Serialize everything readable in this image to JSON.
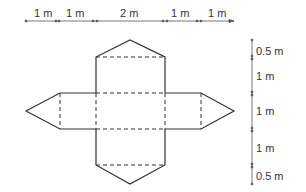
{
  "diagram": {
    "top_dimensions": [
      "1 m",
      "1 m",
      "2 m",
      "1 m",
      "1 m"
    ],
    "right_dimensions": [
      "0.5 m",
      "1 m",
      "1 m",
      "1 m",
      "0.5 m"
    ],
    "colors": {
      "line": "#333333",
      "dimension": "#555555"
    }
  }
}
